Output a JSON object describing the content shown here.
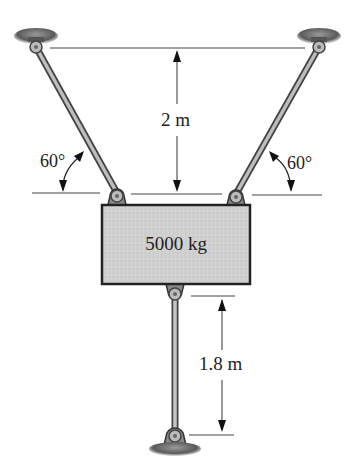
{
  "diagram": {
    "block": {
      "mass_label": "5000 kg",
      "fill": "#cfcfcf",
      "stroke": "#222222"
    },
    "dimensions": {
      "vertical_top": "2 m",
      "vertical_bottom": "1.8 m"
    },
    "angles": {
      "left": "60°",
      "right": "60°"
    },
    "members": [
      {
        "name": "left-inclined-rod",
        "angle": "60°"
      },
      {
        "name": "right-inclined-rod",
        "angle": "60°"
      },
      {
        "name": "bottom-vertical-rod",
        "length": "1.8 m"
      }
    ],
    "supports": [
      "top-left-support",
      "top-right-support",
      "bottom-support"
    ]
  }
}
